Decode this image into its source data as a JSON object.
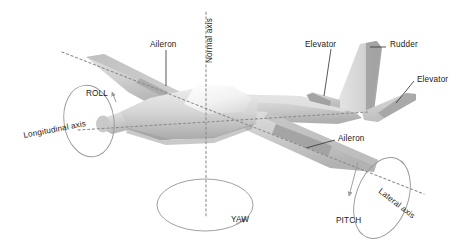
{
  "figure": {
    "background_color": "#ffffff",
    "width": 468,
    "height": 245
  },
  "labels": {
    "aileron_left": "Aileron",
    "aileron_right": "Aileron",
    "elevator_left": "Elevator",
    "elevator_right": "Elevator",
    "rudder": "Rudder",
    "normal_axis": "Normal axis",
    "longitudinal_axis": "Longitudinal axis",
    "lateral_axis": "Lateral axis",
    "roll": "ROLL",
    "pitch": "PITCH",
    "yaw": "YAW"
  },
  "colors": {
    "label_text": "#1a1a1a",
    "leader_line": "#3a3a3a",
    "axis_dashed": "#8b8b8b",
    "rotation_arc": "#9a9a9a",
    "fuselage_light": "#dcdcdc",
    "fuselage_mid": "#c6c6c6",
    "fuselage_dark": "#aeaeae",
    "wing_top": "#d4d4d4",
    "wing_shadow": "#b4b4b4",
    "canopy": "#f4f4f4",
    "control_surface": "#9e9e9e"
  },
  "axes": [
    {
      "name": "normal-axis",
      "label": "Normal axis",
      "orientation": "vertical",
      "rotation": "YAW"
    },
    {
      "name": "longitudinal-axis",
      "label": "Longitudinal axis",
      "orientation": "nose-to-tail",
      "rotation": "ROLL"
    },
    {
      "name": "lateral-axis",
      "label": "Lateral axis",
      "orientation": "wingtip-to-wingtip",
      "rotation": "PITCH"
    }
  ],
  "control_surfaces": [
    {
      "name": "aileron",
      "count": 2,
      "location": "wing trailing edge"
    },
    {
      "name": "elevator",
      "count": 2,
      "location": "horizontal stabilizer"
    },
    {
      "name": "rudder",
      "count": 1,
      "location": "vertical stabilizer"
    }
  ]
}
